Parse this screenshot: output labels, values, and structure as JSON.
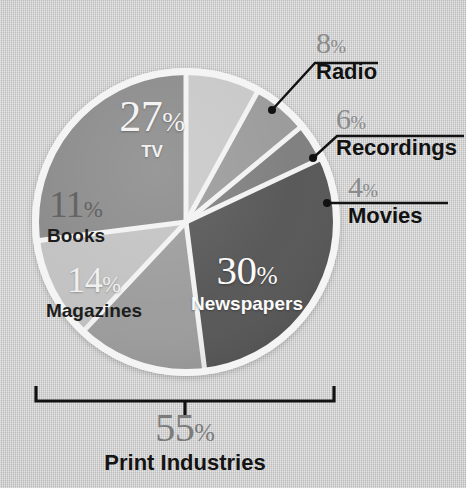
{
  "chart_data": {
    "type": "pie",
    "title": "",
    "xlabel": "",
    "ylabel": "",
    "unit": "%",
    "legend_position": "none",
    "grid": false,
    "categories": [
      "Radio",
      "Recordings",
      "Movies",
      "Newspapers",
      "Magazines",
      "Books",
      "TV"
    ],
    "values": [
      8,
      6,
      4,
      30,
      14,
      11,
      27
    ],
    "slice_colors": [
      "#c8c8c8",
      "#9a9a9a",
      "#7e7e7e",
      "#565656",
      "#9c9c9c",
      "#c2c2c2",
      "#8a8a8a"
    ],
    "start_angle_deg": 0,
    "direction": "clockwise",
    "separator_color": "#f2f2f2",
    "annotations": [
      {
        "label": "Print Industries",
        "value": 55,
        "covers": [
          "Newspapers",
          "Magazines",
          "Books"
        ],
        "style": "bottom-bracket"
      }
    ]
  },
  "background": {
    "color": "#cccccc",
    "texture": "linen"
  },
  "pie": {
    "center_x": 186,
    "center_y": 222,
    "radius": 152,
    "ring_color": "#f4f4f4",
    "slices": [
      {
        "key": "radio",
        "percent_text": "8",
        "sign": "%",
        "name": "Radio",
        "color": "#c8c8c8"
      },
      {
        "key": "recordings",
        "percent_text": "6",
        "sign": "%",
        "name": "Recordings",
        "color": "#9a9a9a"
      },
      {
        "key": "movies",
        "percent_text": "4",
        "sign": "%",
        "name": "Movies",
        "color": "#7e7e7e"
      },
      {
        "key": "newspapers",
        "percent_text": "30",
        "sign": "%",
        "name": "Newspapers",
        "color": "#565656"
      },
      {
        "key": "magazines",
        "percent_text": "14",
        "sign": "%",
        "name": "Magazines",
        "color": "#9c9c9c"
      },
      {
        "key": "books",
        "percent_text": "11",
        "sign": "%",
        "name": "Books",
        "color": "#c2c2c2"
      },
      {
        "key": "tv",
        "percent_text": "27",
        "sign": "%",
        "name": "TV",
        "color": "#8a8a8a"
      }
    ]
  },
  "inside_labels": {
    "tv": {
      "percent": "27",
      "sign": "%",
      "name": "TV"
    },
    "newspapers": {
      "percent": "30",
      "sign": "%",
      "name": "Newspapers"
    },
    "books": {
      "percent": "11",
      "sign": "%",
      "name": "Books"
    },
    "magazines": {
      "percent": "14",
      "sign": "%",
      "name": "Magazines"
    }
  },
  "callouts": [
    {
      "key": "radio",
      "percent": "8",
      "sign": "%",
      "name": "Radio",
      "rule_color": "#121212",
      "leader": "diagonal"
    },
    {
      "key": "recordings",
      "percent": "6",
      "sign": "%",
      "name": "Recordings",
      "rule_color": "#121212",
      "leader": "diagonal"
    },
    {
      "key": "movies",
      "percent": "4",
      "sign": "%",
      "name": "Movies",
      "rule_color": "#121212",
      "leader": "horizontal"
    }
  ],
  "summary": {
    "percent": "55",
    "sign": "%",
    "name": "Print Industries",
    "bracket_color": "#121212"
  }
}
